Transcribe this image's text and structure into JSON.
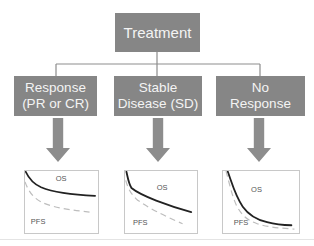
{
  "flowchart": {
    "root": {
      "label": "Treatment"
    },
    "branches": [
      {
        "id": "response",
        "line1": "Response",
        "line2": "(PR or CR)"
      },
      {
        "id": "stable-disease",
        "line1": "Stable",
        "line2": "Disease (SD)"
      },
      {
        "id": "no-response",
        "line1": "No",
        "line2": "Response"
      }
    ]
  },
  "panels": [
    {
      "id": "response-survival",
      "os_label": "OS",
      "pfs_label": "PFS",
      "os_path": "M1,1 C5,9 10,16 22,21 C40,28 70,31 96,32",
      "pfs_path": "M0,14 C4,24 9,33 22,40 C40,48 68,51 89,53"
    },
    {
      "id": "stable-disease-survival",
      "os_label": "OS",
      "pfs_label": "PFS",
      "os_path": "M2,1 C4,9 5,16 9,22 C22,32 60,45 92,53",
      "pfs_path": "M1,12 C4,22 8,30 18,38 C40,52 65,62 80,68"
    },
    {
      "id": "no-response-survival",
      "os_label": "OS",
      "pfs_label": "PFS",
      "os_path": "M6,0 C12,16 16,32 26,46 C34,57 45,63 58,66 C72,70 84,70 90,70",
      "pfs_path": "M4,0 C8,14 11,30 18,45 C25,58 33,64 45,68 C60,73 80,74 94,75"
    }
  ],
  "colors": {
    "box_fill": "#868686",
    "box_text": "#f4f4f4",
    "connector": "#8d8d8d",
    "arrow_fill": "#8d8d8d",
    "panel_border": "#c8c8c8",
    "panel_fill": "#ffffff",
    "os_curve": "#222222",
    "pfs_curve": "#bdbdbd",
    "curve_label": "#555555",
    "page_rule": "#e4e4e4"
  }
}
